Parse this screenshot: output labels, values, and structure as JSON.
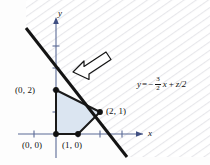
{
  "figure": {
    "axes": {
      "x_label": "x",
      "y_label": "y",
      "origin_px": [
        56,
        134
      ],
      "unit_px": 22,
      "x_ticks": [
        -1,
        1,
        2,
        3
      ],
      "y_ticks": [
        1,
        2,
        3,
        4
      ]
    },
    "equation": {
      "lhs": "y",
      "eq": "=",
      "sign": "−",
      "frac_num": "3",
      "frac_den": "2",
      "term_x": "x",
      "plus": "+",
      "term_z": "z/2",
      "plain": "y = -3/2 x + z/2"
    },
    "points": [
      {
        "name": "origin",
        "label": "(0, 0)",
        "x": 0,
        "y": 0
      },
      {
        "name": "x-intercept",
        "label": "(1, 0)",
        "x": 1,
        "y": 0
      },
      {
        "name": "corner-2-1",
        "label": "(2, 1)",
        "x": 2,
        "y": 1
      },
      {
        "name": "y-intercept",
        "label": "(0, 2)",
        "x": 0,
        "y": 2
      }
    ],
    "feasible_region": {
      "vertices": [
        [
          0,
          0
        ],
        [
          1,
          0
        ],
        [
          2,
          1
        ],
        [
          0,
          2
        ]
      ],
      "fill_color": "#dbe5f1",
      "edge_color": "#1a1a1a"
    },
    "objective_line": {
      "slope": -1.5,
      "passes_through": [
        2,
        1
      ],
      "color": "#141414",
      "width_px": 3
    },
    "hatch_region": {
      "description": "faint diagonal hatching above objective line",
      "color": "#e8e8ea"
    },
    "arrow_annotation": {
      "name": "direction-of-decrease-arrow",
      "direction": "down-left",
      "color": "#141414"
    },
    "colors": {
      "axis": "#5b6b96",
      "line": "#141414",
      "region_fill": "#dbe5f1",
      "text": "#111111"
    }
  }
}
